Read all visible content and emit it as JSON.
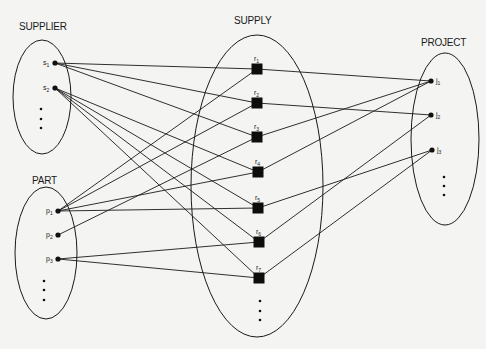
{
  "sets": {
    "supplier": {
      "label": "SUPPLIER",
      "cx": 42,
      "cy": 97,
      "rx": 29,
      "ry": 57,
      "lx": 19,
      "ly": 30
    },
    "part": {
      "label": "PART",
      "cx": 46,
      "cy": 253,
      "rx": 31,
      "ry": 66,
      "lx": 32,
      "ly": 184
    },
    "supply": {
      "label": "SUPPLY",
      "cx": 257,
      "cy": 186,
      "rx": 66,
      "ry": 151,
      "lx": 234,
      "ly": 24
    },
    "project": {
      "label": "PROJECT",
      "cx": 445,
      "cy": 139,
      "rx": 34,
      "ry": 86,
      "lx": 421,
      "ly": 46
    }
  },
  "nodes": {
    "s1": {
      "base": "s",
      "sub": "1",
      "x": 55,
      "y": 63,
      "type": "dot",
      "label_side": "left"
    },
    "s2": {
      "base": "s",
      "sub": "2",
      "x": 55,
      "y": 88,
      "type": "dot",
      "label_side": "left"
    },
    "p1": {
      "base": "p",
      "sub": "1",
      "x": 58,
      "y": 211,
      "type": "dot",
      "label_side": "left"
    },
    "p2": {
      "base": "p",
      "sub": "2",
      "x": 58,
      "y": 235,
      "type": "dot",
      "label_side": "left"
    },
    "p3": {
      "base": "p",
      "sub": "3",
      "x": 58,
      "y": 259,
      "type": "dot",
      "label_side": "left"
    },
    "r1": {
      "base": "r",
      "sub": "1",
      "x": 257,
      "y": 69,
      "type": "square",
      "label_side": "top"
    },
    "r2": {
      "base": "r",
      "sub": "2",
      "x": 257,
      "y": 103,
      "type": "square",
      "label_side": "top"
    },
    "r3": {
      "base": "r",
      "sub": "3",
      "x": 257,
      "y": 137,
      "type": "square",
      "label_side": "top"
    },
    "r4": {
      "base": "r",
      "sub": "4",
      "x": 258,
      "y": 172,
      "type": "square",
      "label_side": "top"
    },
    "r5": {
      "base": "r",
      "sub": "5",
      "x": 258,
      "y": 208,
      "type": "square",
      "label_side": "top"
    },
    "r6": {
      "base": "r",
      "sub": "6",
      "x": 259,
      "y": 242,
      "type": "square",
      "label_side": "top"
    },
    "r7": {
      "base": "r",
      "sub": "7",
      "x": 259,
      "y": 278,
      "type": "square",
      "label_side": "top"
    },
    "j1": {
      "base": "j",
      "sub": "1",
      "x": 431,
      "y": 81,
      "type": "dot",
      "label_side": "right"
    },
    "j2": {
      "base": "j",
      "sub": "2",
      "x": 431,
      "y": 115,
      "type": "dot",
      "label_side": "right"
    },
    "j3": {
      "base": "j",
      "sub": "3",
      "x": 432,
      "y": 150,
      "type": "dot",
      "label_side": "right"
    }
  },
  "ellipsis": {
    "supplier": {
      "x": 41,
      "ys": [
        109,
        119,
        128
      ]
    },
    "part": {
      "x": 44,
      "ys": [
        281,
        290,
        300
      ]
    },
    "supply": {
      "x": 260,
      "ys": [
        301,
        311,
        320
      ]
    },
    "project": {
      "x": 444,
      "ys": [
        177,
        186,
        195
      ]
    }
  },
  "edges": [
    [
      "s1",
      "r1"
    ],
    [
      "s1",
      "r2"
    ],
    [
      "s1",
      "r3"
    ],
    [
      "s2",
      "r4"
    ],
    [
      "s2",
      "r5"
    ],
    [
      "s2",
      "r6"
    ],
    [
      "s2",
      "r7"
    ],
    [
      "p1",
      "r1"
    ],
    [
      "p1",
      "r2"
    ],
    [
      "p1",
      "r4"
    ],
    [
      "p1",
      "r5"
    ],
    [
      "p2",
      "r3"
    ],
    [
      "p3",
      "r6"
    ],
    [
      "p3",
      "r7"
    ],
    [
      "r1",
      "j1"
    ],
    [
      "r2",
      "j2"
    ],
    [
      "r3",
      "j1"
    ],
    [
      "r4",
      "j1"
    ],
    [
      "r5",
      "j3"
    ],
    [
      "r6",
      "j2"
    ],
    [
      "r7",
      "j3"
    ]
  ],
  "colors": {
    "ink": "#1a1a1a",
    "paper": "#f4f4f2"
  }
}
